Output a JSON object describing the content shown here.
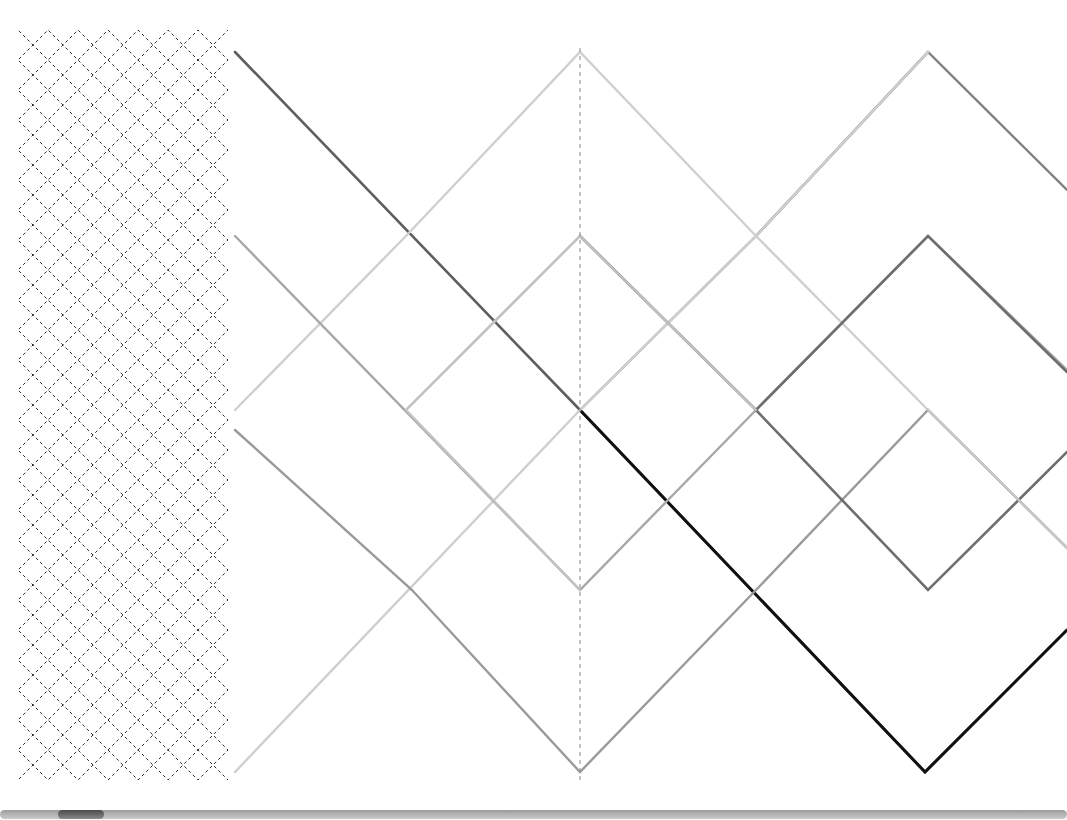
{
  "canvas": {
    "width": 1067,
    "height": 806,
    "background": "#ffffff",
    "description": "Zigzag diagonal polyline pattern canvas"
  },
  "palette": {
    "black": "#111111",
    "dark_gray": "#5e5e5e",
    "mid_gray": "#777777",
    "gray": "#909090",
    "light_gray": "#b0b0b0",
    "lighter_gray": "#c6c6c6",
    "lightest_gray": "#d8d8d8",
    "dashed_black": "#2a2a2a",
    "axis_dash": "#8c8c8c",
    "scrollbar_track": "#b3b3b3",
    "scrollbar_thumb": "#5a5a5a"
  },
  "geometry": {
    "amplitude": 180,
    "period": 360,
    "baseline_y": 410,
    "left_panel_right_edge": 228,
    "main_left_edge": 235,
    "center_x": 580,
    "top_peak_y": 52,
    "mid_peak_y": 236,
    "bottom_valley_y": 772,
    "second_center_x": 928
  },
  "left_panel": {
    "name": "dashed-lattice-panel",
    "x": 18,
    "y": 30,
    "width": 210,
    "height": 750,
    "dash_pattern": "3 3",
    "stroke_width": 1,
    "stroke_color": "#2a2a2a",
    "diagonal_spacing": 60,
    "sub_spacing": 30
  },
  "axis": {
    "name": "center-vertical-dashed-axis",
    "x": 580,
    "y1": 48,
    "y2": 780,
    "dash_pattern": "4 4",
    "stroke_color": "#8c8c8c",
    "stroke_width": 1
  },
  "polylines": [
    {
      "id": "line-1",
      "label": "Dark gray descending wave (top-left origin)",
      "color": "#5e5e5e",
      "width": 2.6,
      "points": "235,52 580,410 925,772 1067,630"
    },
    {
      "id": "line-2",
      "label": "Black emphasized wave from center",
      "color": "#111111",
      "width": 3.0,
      "points": "580,410 925,772 1067,630"
    },
    {
      "id": "line-3",
      "label": "Mid gray wave peaking at second center top",
      "color": "#808080",
      "width": 2.4,
      "points": "756,236 928,52 1067,190"
    },
    {
      "id": "line-4",
      "label": "Mid gray wave descending from second peak",
      "color": "#8a8a8a",
      "width": 2.4,
      "points": "580,410 756,236 928,52"
    },
    {
      "id": "line-5",
      "label": "Light gray rising wave to top center peak",
      "color": "#cfcfcf",
      "width": 2.4,
      "points": "235,410 406,236 580,52 756,236 928,410 1067,548"
    },
    {
      "id": "line-6",
      "label": "Light gray long rising wave from bottom-left",
      "color": "#cfcfcf",
      "width": 2.4,
      "points": "235,772 580,410 756,236 928,52"
    },
    {
      "id": "line-7",
      "label": "Gray wave starting mid-left going down-right",
      "color": "#a8a8a8",
      "width": 2.4,
      "points": "235,236 580,590 756,410 928,236 1067,370"
    },
    {
      "id": "line-8",
      "label": "Gray wave lower left, valley at center bottom",
      "color": "#9a9a9a",
      "width": 2.4,
      "points": "235,430 412,590 580,772 756,590 928,410 1067,548"
    },
    {
      "id": "line-9",
      "label": "Dark gray wave with peak at second center mid",
      "color": "#6e6e6e",
      "width": 2.6,
      "points": "580,236 756,410 928,236 1067,372"
    },
    {
      "id": "line-10",
      "label": "Dark gray wave from second mid peak descending",
      "color": "#6e6e6e",
      "width": 2.6,
      "points": "756,410 928,590 1067,452"
    },
    {
      "id": "line-11",
      "label": "Light gray short descending segment right edge",
      "color": "#c8c8c8",
      "width": 2.4,
      "points": "928,410 1067,548"
    },
    {
      "id": "line-12",
      "label": "Light gray rising to center mid peak",
      "color": "#c2c2c2",
      "width": 2.4,
      "points": "406,410 580,236 756,410"
    },
    {
      "id": "line-13",
      "label": "Light gray from center mid peak down to center valley",
      "color": "#c2c2c2",
      "width": 2.4,
      "points": "580,236 406,410 580,590 580,590"
    }
  ],
  "scrollbar": {
    "name": "horizontal-scrollbar",
    "orientation": "horizontal",
    "track_color": "#b3b3b3",
    "thumb_color": "#5a5a5a",
    "thumb_left_px": 58,
    "thumb_width_px": 46,
    "track_width_px": 1067
  }
}
